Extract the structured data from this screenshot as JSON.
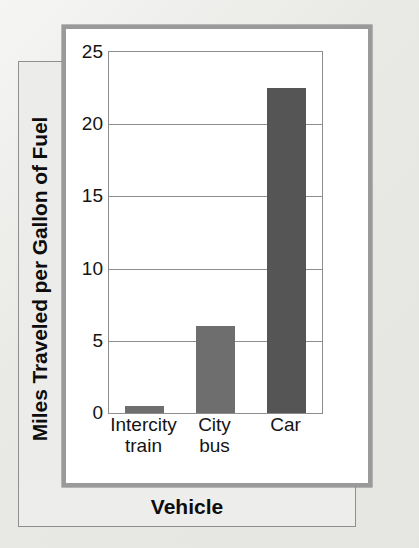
{
  "figure": {
    "background_color": "#e9e9e6",
    "panel_background": "#ffffff",
    "panel_border_color": "#9a9a9a",
    "axis_color": "#8d8d8d"
  },
  "chart_data": {
    "type": "bar",
    "title": "",
    "subtitle": "",
    "xlabel": "Vehicle",
    "ylabel": "Miles Traveled per Gallon of Fuel",
    "categories": [
      "Intercity train",
      "City bus",
      "Car"
    ],
    "category_lines": [
      [
        "Intercity",
        "train"
      ],
      [
        "City",
        "bus"
      ],
      [
        "Car"
      ]
    ],
    "values": [
      0.5,
      6,
      22.5
    ],
    "ylim": [
      0,
      25
    ],
    "ytick_values": [
      0,
      5,
      10,
      15,
      20,
      25
    ],
    "ytick_labels": [
      "0",
      "5",
      "10",
      "15",
      "20",
      "25"
    ],
    "ytick_step": 5,
    "grid": true,
    "grid_axis": "y",
    "legend": false,
    "legend_position": "none",
    "bar_colors": [
      "#6e6e6e",
      "#6e6e6e",
      "#555555"
    ],
    "bar_width_fraction": 0.56
  }
}
